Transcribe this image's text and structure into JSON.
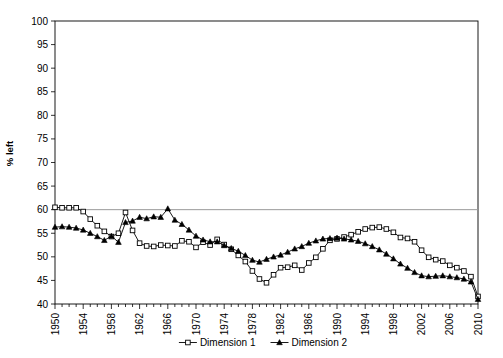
{
  "figure": {
    "top_caption": "",
    "y_axis_title": "% left"
  },
  "chart_data": {
    "type": "line",
    "title": "",
    "subtitle": "",
    "xlabel": "",
    "ylabel": "% left",
    "ylim": [
      40,
      100
    ],
    "ytick_step": 5,
    "yticks": [
      40,
      45,
      50,
      55,
      60,
      65,
      70,
      75,
      80,
      85,
      90,
      95,
      100
    ],
    "xlim": [
      1950,
      2010
    ],
    "xticks": [
      1950,
      1954,
      1958,
      1962,
      1966,
      1970,
      1974,
      1978,
      1982,
      1986,
      1990,
      1994,
      1998,
      2002,
      2006,
      2010
    ],
    "xtick_minor_step": 1,
    "xtick_label_rotation": -90,
    "grid": false,
    "reference_lines": [
      {
        "axis": "y",
        "value": 60,
        "color": "#999999"
      }
    ],
    "legend": {
      "position": "bottom",
      "entries": [
        "Dimension 1",
        "Dimension 2"
      ]
    },
    "x": [
      1950,
      1951,
      1952,
      1953,
      1954,
      1955,
      1956,
      1957,
      1958,
      1959,
      1960,
      1961,
      1962,
      1963,
      1964,
      1965,
      1966,
      1967,
      1968,
      1969,
      1970,
      1971,
      1972,
      1973,
      1974,
      1975,
      1976,
      1977,
      1978,
      1979,
      1980,
      1981,
      1982,
      1983,
      1984,
      1985,
      1986,
      1987,
      1988,
      1989,
      1990,
      1991,
      1992,
      1993,
      1994,
      1995,
      1996,
      1997,
      1998,
      1999,
      2000,
      2001,
      2002,
      2003,
      2004,
      2005,
      2006,
      2007,
      2008,
      2009,
      2010
    ],
    "series": [
      {
        "name": "Dimension 1",
        "marker": "open-square",
        "color": "#000000",
        "values": [
          60.5,
          60.4,
          60.4,
          60.4,
          59.6,
          58.0,
          56.6,
          55.4,
          54.3,
          55.0,
          59.4,
          55.6,
          52.9,
          52.3,
          52.2,
          52.5,
          52.4,
          52.3,
          53.4,
          53.2,
          52.0,
          53.1,
          52.5,
          53.7,
          52.6,
          51.6,
          50.3,
          49.0,
          47.0,
          45.3,
          44.5,
          46.2,
          47.7,
          47.8,
          48.2,
          47.2,
          48.7,
          49.9,
          51.7,
          53.5,
          53.8,
          54.2,
          54.7,
          55.3,
          55.9,
          56.2,
          56.3,
          55.9,
          55.2,
          54.1,
          53.9,
          53.2,
          51.4,
          49.9,
          49.4,
          49.1,
          48.2,
          47.7,
          47.0,
          45.8,
          41.6
        ]
      },
      {
        "name": "Dimension 2",
        "marker": "filled-triangle",
        "color": "#000000",
        "values": [
          56.3,
          56.4,
          56.3,
          56.1,
          55.7,
          55.0,
          54.3,
          53.5,
          54.4,
          53.1,
          57.3,
          57.6,
          58.4,
          58.1,
          58.5,
          58.4,
          60.2,
          57.8,
          56.9,
          55.7,
          54.4,
          53.6,
          53.2,
          53.2,
          52.4,
          51.8,
          51.2,
          50.3,
          49.3,
          48.9,
          49.5,
          50.0,
          50.4,
          51.0,
          51.7,
          52.2,
          52.9,
          53.4,
          53.8,
          53.9,
          54.0,
          53.8,
          53.6,
          53.3,
          52.8,
          52.2,
          51.5,
          50.6,
          49.6,
          48.5,
          47.6,
          46.7,
          46.0,
          45.8,
          45.9,
          46.0,
          45.8,
          45.6,
          45.3,
          44.7,
          41.0
        ]
      }
    ]
  }
}
